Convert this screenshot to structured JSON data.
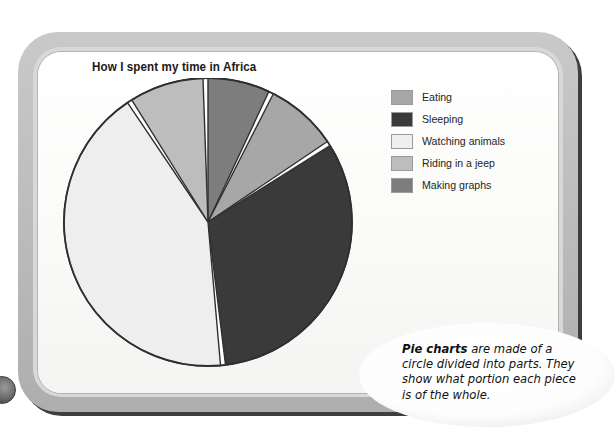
{
  "chart_data": {
    "type": "pie",
    "title": "How I spent my time in Africa",
    "categories": [
      "Eating",
      "Sleeping",
      "Watching animals",
      "Riding in a jeep",
      "Making graphs"
    ],
    "values": [
      8,
      32,
      42,
      11,
      7
    ],
    "unit": "percent",
    "legend_position": "right",
    "grid": false,
    "slices": [
      {
        "label": "Making graphs",
        "value": 7,
        "color": "#7d7d7d",
        "start_deg": 0,
        "end_deg": 25
      },
      {
        "label": "Eating",
        "value": 8,
        "color": "#a7a7a7",
        "start_deg": 27,
        "end_deg": 56
      },
      {
        "label": "Sleeping",
        "value": 32,
        "color": "#3a3a3a",
        "start_deg": 58,
        "end_deg": 173
      },
      {
        "label": "Watching animals",
        "value": 42,
        "color": "#eeeeee",
        "start_deg": 175,
        "end_deg": 326
      },
      {
        "label": "Riding in a jeep",
        "value": 11,
        "color": "#bdbdbd",
        "start_deg": 328,
        "end_deg": 358
      }
    ],
    "outline_color": "#2f2f2f",
    "gap_color": "#ffffff"
  },
  "chart": {
    "title": "How I spent my time in Africa"
  },
  "legend": {
    "items": [
      {
        "label": "Eating",
        "color": "#a7a7a7"
      },
      {
        "label": "Sleeping",
        "color": "#3a3a3a"
      },
      {
        "label": "Watching animals",
        "color": "#efefef"
      },
      {
        "label": "Riding in a jeep",
        "color": "#bdbdbd"
      },
      {
        "label": "Making graphs",
        "color": "#7d7d7d"
      }
    ]
  },
  "callout": {
    "lead": "Pie charts",
    "body": " are made of a circle divided into parts. They show what portion each piece is of the whole."
  }
}
